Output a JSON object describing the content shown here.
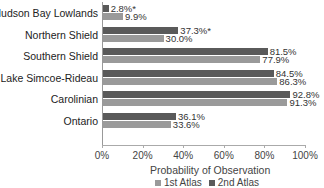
{
  "chart_data": {
    "type": "bar",
    "orientation": "horizontal",
    "title": "",
    "xlabel": "Probability of Observation",
    "ylabel": "",
    "xlim": [
      0,
      100
    ],
    "x_ticks": [
      "0%",
      "20%",
      "40%",
      "60%",
      "80%",
      "100%"
    ],
    "grid": false,
    "legend_position": "bottom",
    "categories": [
      "Hudson Bay Lowlands",
      "Northern Shield",
      "Southern Shield",
      "Lake Simcoe-Rideau",
      "Carolinian",
      "Ontario"
    ],
    "series": [
      {
        "name": "2nd Atlas",
        "color": "#5a5a5a",
        "values": [
          2.8,
          37.3,
          81.5,
          84.5,
          92.8,
          36.1
        ],
        "labels": [
          "2.8%*",
          "37.3%*",
          "81.5%",
          "84.5%",
          "92.8%",
          "36.1%"
        ]
      },
      {
        "name": "1st Atlas",
        "color": "#9a9a9a",
        "values": [
          9.9,
          30.0,
          77.9,
          86.3,
          91.3,
          33.6
        ],
        "labels": [
          "9.9%",
          "30.0%",
          "77.9%",
          "86.3%",
          "91.3%",
          "33.6%"
        ]
      }
    ],
    "legend": [
      "1st Atlas",
      "2nd Atlas"
    ]
  }
}
